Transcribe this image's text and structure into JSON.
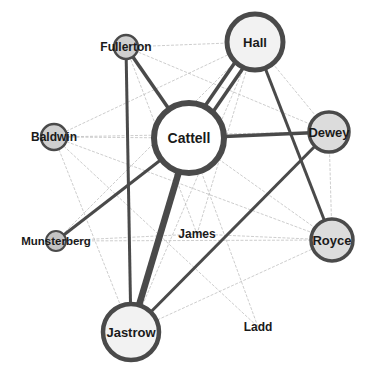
{
  "diagram": {
    "type": "network",
    "colors": {
      "background": "#ffffff",
      "strong_edge": "#4a4a4a",
      "weak_edge": "#b8b8b8",
      "node_stroke": "#4a4a4a",
      "node_fill_large": "#f2f2f2",
      "node_fill_small": "#cfcfcf",
      "label": "#1a1a1a"
    },
    "nodes": [
      {
        "id": "hall",
        "label": "Hall",
        "x": 255,
        "y": 42,
        "r": 28,
        "stroke": 5,
        "fill": "#f2f2f2",
        "font": 13
      },
      {
        "id": "fullerton",
        "label": "Fullerton",
        "x": 126,
        "y": 47,
        "r": 12,
        "stroke": 2.5,
        "fill": "#cfcfcf",
        "font": 12
      },
      {
        "id": "cattell",
        "label": "Cattell",
        "x": 189,
        "y": 138,
        "r": 35,
        "stroke": 6,
        "fill": "#ffffff",
        "font": 14
      },
      {
        "id": "baldwin",
        "label": "Baldwin",
        "x": 54,
        "y": 137,
        "r": 13,
        "stroke": 2.5,
        "fill": "#cfcfcf",
        "font": 12
      },
      {
        "id": "dewey",
        "label": "Dewey",
        "x": 329,
        "y": 132,
        "r": 20,
        "stroke": 3.5,
        "fill": "#dcdcdc",
        "font": 13
      },
      {
        "id": "munsterberg",
        "label": "Munsterberg",
        "x": 56,
        "y": 241,
        "r": 10,
        "stroke": 2,
        "fill": "#c4c4c4",
        "font": 11.5
      },
      {
        "id": "james",
        "label": "James",
        "x": 197,
        "y": 234,
        "r": 0,
        "stroke": 0,
        "fill": "none",
        "font": 12
      },
      {
        "id": "royce",
        "label": "Royce",
        "x": 332,
        "y": 240,
        "r": 21,
        "stroke": 3.5,
        "fill": "#dcdcdc",
        "font": 13
      },
      {
        "id": "jastrow",
        "label": "Jastrow",
        "x": 131,
        "y": 332,
        "r": 28,
        "stroke": 4.5,
        "fill": "#f2f2f2",
        "font": 13
      },
      {
        "id": "ladd",
        "label": "Ladd",
        "x": 258,
        "y": 327,
        "r": 0,
        "stroke": 0,
        "fill": "none",
        "font": 12
      }
    ],
    "edges": [
      {
        "from": "hall",
        "to": "cattell",
        "weight": 3.5,
        "offset": -5
      },
      {
        "from": "hall",
        "to": "cattell",
        "weight": 3.5,
        "offset": 5
      },
      {
        "from": "hall",
        "to": "royce",
        "weight": 3
      },
      {
        "from": "fullerton",
        "to": "cattell",
        "weight": 3.5
      },
      {
        "from": "fullerton",
        "to": "jastrow",
        "weight": 3
      },
      {
        "from": "cattell",
        "to": "dewey",
        "weight": 3.5
      },
      {
        "from": "cattell",
        "to": "munsterberg",
        "weight": 3
      },
      {
        "from": "cattell",
        "to": "jastrow",
        "weight": 6.5
      },
      {
        "from": "dewey",
        "to": "jastrow",
        "weight": 3
      },
      {
        "from": "fullerton",
        "to": "hall",
        "weight": 0.7,
        "weak": true
      },
      {
        "from": "fullerton",
        "to": "dewey",
        "weight": 0.7,
        "weak": true
      },
      {
        "from": "fullerton",
        "to": "james",
        "weight": 0.7,
        "weak": true
      },
      {
        "from": "baldwin",
        "to": "hall",
        "weight": 0.7,
        "weak": true
      },
      {
        "from": "baldwin",
        "to": "cattell",
        "weight": 0.7,
        "weak": true
      },
      {
        "from": "baldwin",
        "to": "royce",
        "weight": 0.7,
        "weak": true
      },
      {
        "from": "baldwin",
        "to": "ladd",
        "weight": 0.7,
        "weak": true
      },
      {
        "from": "baldwin",
        "to": "jastrow",
        "weight": 0.7,
        "weak": true
      },
      {
        "from": "baldwin",
        "to": "dewey",
        "weight": 0.7,
        "weak": true
      },
      {
        "from": "hall",
        "to": "dewey",
        "weight": 0.7,
        "weak": true
      },
      {
        "from": "hall",
        "to": "james",
        "weight": 0.7,
        "weak": true
      },
      {
        "from": "hall",
        "to": "munsterberg",
        "weight": 0.7,
        "weak": true
      },
      {
        "from": "hall",
        "to": "jastrow",
        "weight": 0.7,
        "weak": true
      },
      {
        "from": "cattell",
        "to": "royce",
        "weight": 0.7,
        "weak": true
      },
      {
        "from": "cattell",
        "to": "ladd",
        "weight": 0.7,
        "weak": true
      },
      {
        "from": "munsterberg",
        "to": "royce",
        "weight": 0.7,
        "weak": true
      },
      {
        "from": "munsterberg",
        "to": "james",
        "weight": 0.7,
        "weak": true
      },
      {
        "from": "dewey",
        "to": "royce",
        "weight": 0.7,
        "weak": true
      },
      {
        "from": "royce",
        "to": "jastrow",
        "weight": 0.7,
        "weak": true
      },
      {
        "from": "james",
        "to": "royce",
        "weight": 0.7,
        "weak": true
      }
    ]
  }
}
